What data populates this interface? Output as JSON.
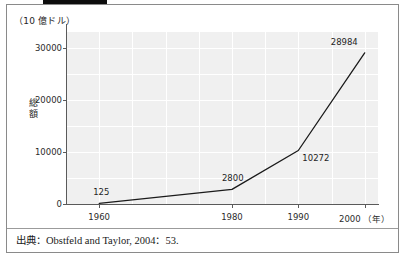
{
  "figure": {
    "unit_label": "（10 億ドル）",
    "source_text": "出典：Obstfeld and Taylor, 2004：53.",
    "frame_color": "#8a8a8a",
    "plot_background": "#f0f0f0",
    "gridline_color": "#ffffff",
    "line_color": "#1a1a1a"
  },
  "chart_data": {
    "type": "line",
    "title": "",
    "xlabel": "（年）",
    "ylabel": "総額",
    "unit": "10 億ドル",
    "x": [
      1960,
      1980,
      1990,
      2000
    ],
    "values": [
      125,
      2800,
      10272,
      28984
    ],
    "point_labels": [
      "125",
      "2800",
      "10272",
      "28984"
    ],
    "xticks": [
      1960,
      1980,
      1990,
      2000
    ],
    "xtick_labels": [
      "1960",
      "1980",
      "1990",
      "2000"
    ],
    "x_axis_suffix": "（年）",
    "yticks": [
      0,
      10000,
      20000,
      30000
    ],
    "ytick_labels": [
      "0",
      "10000",
      "20000",
      "30000"
    ],
    "xlim": [
      1955,
      2002
    ],
    "ylim": [
      0,
      33000
    ],
    "grid": true,
    "legend": "none",
    "series_name": "総額"
  },
  "source": {
    "label": "出典",
    "separator": "：",
    "citation": "Obstfeld and Taylor, 2004：53."
  }
}
